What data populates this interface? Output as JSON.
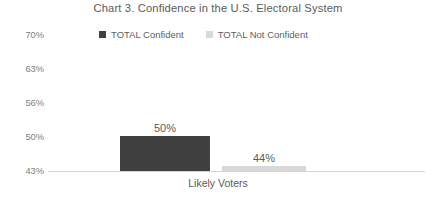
{
  "chart_data": {
    "type": "bar",
    "title": "Chart 3. Confidence in the U.S. Electoral System",
    "xlabel": "Likely Voters",
    "ylabel": "",
    "categories": [
      "Likely Voters"
    ],
    "series": [
      {
        "name": "TOTAL Confident",
        "values": [
          50
        ],
        "color": "#404040",
        "labels": [
          "50%"
        ]
      },
      {
        "name": "TOTAL Not Confident",
        "values": [
          44
        ],
        "color": "#D8D8D8",
        "labels": [
          "44%"
        ]
      }
    ],
    "ylim": [
      43,
      70
    ],
    "ytick_labels": [
      "70%",
      "63%",
      "56%",
      "50%",
      "43%"
    ],
    "ytick_values": [
      70,
      63,
      56,
      50,
      43
    ],
    "grid": false,
    "legend_position": "top-center",
    "axis_color": "#D4D4D4"
  },
  "title": {
    "text": "Chart 3. Confidence in the U.S. Electoral System"
  },
  "legend": {
    "items": [
      {
        "label": "TOTAL Confident",
        "color": "#404040"
      },
      {
        "label": "TOTAL Not Confident",
        "color": "#D8D8D8"
      }
    ]
  },
  "yaxis": {
    "ticks": [
      {
        "label": "70%"
      },
      {
        "label": "63%"
      },
      {
        "label": "56%"
      },
      {
        "label": "50%"
      },
      {
        "label": "43%"
      }
    ]
  },
  "bars": [
    {
      "label": "50%",
      "series": "TOTAL Confident"
    },
    {
      "label": "44%",
      "series": "TOTAL Not Confident"
    }
  ],
  "xaxis": {
    "category": "Likely Voters"
  }
}
